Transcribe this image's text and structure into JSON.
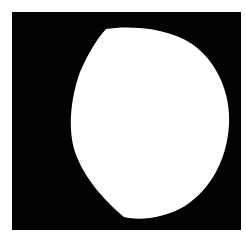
{
  "image": {
    "description": "Binary mask image: white rounded blob on black square background",
    "background_color": "#ffffff",
    "frame_color": "#020202",
    "shape_color": "#ffffff",
    "frame": {
      "x": 12,
      "y": 12,
      "width": 229,
      "height": 218
    },
    "shape": {
      "type": "irregular-circle",
      "path": "M106 29 C 125 26, 165 26, 192 44 C 218 62, 231 95, 229 125 C 227 160, 210 190, 185 206 C 165 218, 140 221, 124 217 C 104 200, 84 178, 75 152 C 68 130, 70 100, 80 72 C 88 54, 96 40, 106 29 Z"
    }
  }
}
